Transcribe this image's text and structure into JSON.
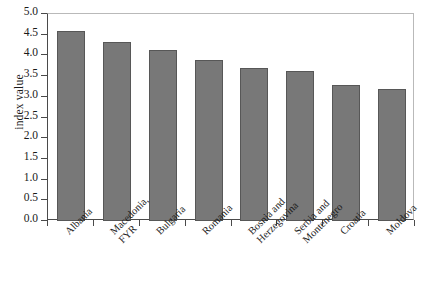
{
  "chart_data": {
    "type": "bar",
    "title": "",
    "subtitle": "",
    "xlabel": "",
    "ylabel": "index value",
    "categories": [
      "Albania",
      "Macedonia, FYR",
      "Bulgaria",
      "Romania",
      "Bosnia and Herzegovina",
      "Serbia and Montenegro",
      "Croatia",
      "Moldova"
    ],
    "category_lines": [
      [
        "Albania"
      ],
      [
        "Macedonia,",
        "FYR"
      ],
      [
        "Bulgaria"
      ],
      [
        "Romania"
      ],
      [
        "Bosnia and",
        "Herzegovina"
      ],
      [
        "Serbia and",
        "Montenegro"
      ],
      [
        "Croatia"
      ],
      [
        "Moldova"
      ]
    ],
    "values": [
      4.6,
      4.33,
      4.12,
      3.9,
      3.7,
      3.62,
      3.28,
      3.18
    ],
    "ylim": [
      0.0,
      5.0
    ],
    "ytick_step": 0.5,
    "yticks": [
      "5.0",
      "4.5",
      "4.0",
      "3.5",
      "3.0",
      "2.5",
      "2.0",
      "1.5",
      "1.0",
      "0.5",
      "0.0"
    ],
    "grid": false,
    "legend": false,
    "legend_position": "none",
    "bar_color": "#787878",
    "bar_border_color": "#575757",
    "axis_color": "#4a4a4a",
    "frame_color": "#b9b9b9",
    "background_color": "#ffffff",
    "tick_label_rotation_deg": -45
  }
}
